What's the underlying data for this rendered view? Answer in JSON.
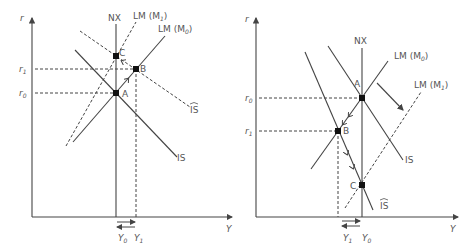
{
  "diagrams": [
    {
      "id": "left",
      "axes": {
        "y_label": "r",
        "x_label": "Y"
      },
      "curves": {
        "nx": "NX",
        "lm0": "LM (M",
        "lm0_sub": "0",
        "lm1": "LM (M",
        "lm1_sub": "1",
        "is": "IS",
        "is_hat": "IS"
      },
      "points": {
        "a": "A",
        "b": "B",
        "c": "C"
      },
      "y_ticks": {
        "r1": "r",
        "r1_sub": "1",
        "r0": "r",
        "r0_sub": "0"
      },
      "x_ticks": {
        "y0": "Y",
        "y0_sub": "0",
        "y1": "Y",
        "y1_sub": "1"
      }
    },
    {
      "id": "right",
      "axes": {
        "y_label": "r",
        "x_label": "Y"
      },
      "curves": {
        "nx": "NX",
        "lm0": "LM (M",
        "lm0_sub": "0",
        "lm1": "LM (M",
        "lm1_sub": "1",
        "is": "IS",
        "is_hat": "IS"
      },
      "points": {
        "a": "A",
        "b": "B",
        "c": "C"
      },
      "y_ticks": {
        "r0": "r",
        "r0_sub": "0",
        "r1": "r",
        "r1_sub": "1"
      },
      "x_ticks": {
        "y1": "Y",
        "y1_sub": "1",
        "y0": "Y",
        "y0_sub": "0"
      }
    }
  ],
  "colors": {
    "line": "#444444",
    "text": "#555555",
    "point": "#111111",
    "background": "#ffffff"
  }
}
